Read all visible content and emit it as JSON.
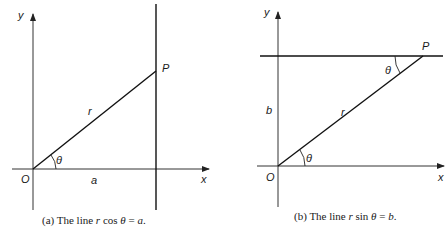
{
  "panel_a": {
    "axis_y_label": "y",
    "axis_x_label": "x",
    "origin_label": "O",
    "point_label": "P",
    "radius_label": "r",
    "angle_label": "θ",
    "segment_label": "a",
    "caption_prefix": "(a)  The line ",
    "caption_r": "r",
    "caption_func": " cos ",
    "caption_theta": "θ",
    "caption_eq": " = ",
    "caption_rhs": "a",
    "caption_end": "."
  },
  "panel_b": {
    "axis_y_label": "y",
    "axis_x_label": "x",
    "origin_label": "O",
    "point_label": "P",
    "radius_label": "r",
    "angle_label_origin": "θ",
    "angle_label_p": "θ",
    "height_label": "b",
    "caption_prefix": "(b)  The line ",
    "caption_r": "r",
    "caption_func": " sin ",
    "caption_theta": "θ",
    "caption_eq": " = ",
    "caption_rhs": "b",
    "caption_end": "."
  },
  "colors": {
    "ink": "#111111",
    "background": "#ffffff"
  }
}
